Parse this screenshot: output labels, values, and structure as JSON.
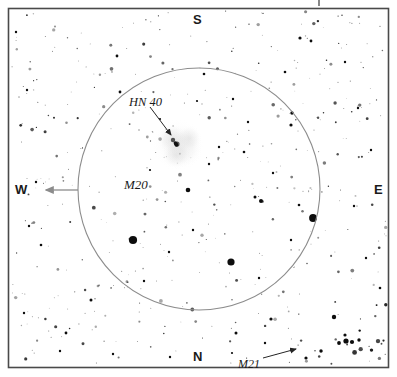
{
  "figure": {
    "kind": "astronomical-finder-chart",
    "frame_color": "#4a4a4a",
    "background_color": "#ffffff",
    "star_color": "#0d0d0d",
    "circle_color": "#8c8c8c",
    "arrow_color": "#8c8c8c",
    "nebula_color": "#c9c9c9"
  },
  "compass": {
    "north": "N",
    "south": "S",
    "east": "E",
    "west": "W"
  },
  "labels": {
    "hn40": "HN 40",
    "m20": "M20",
    "m21": "M21"
  },
  "chart_data": {
    "type": "scatter",
    "title": "",
    "xlabel": "",
    "ylabel": "",
    "xlim": [
      8,
      389
    ],
    "ylim": [
      8,
      368
    ],
    "grid": false,
    "legend": null,
    "annotations": [
      {
        "text": "HN 40",
        "x": 129,
        "y": 96,
        "arrow_to": [
          171,
          135
        ],
        "arrow_from": [
          150,
          107
        ]
      },
      {
        "text": "M20",
        "x": 124,
        "y": 178,
        "arrow_to": null,
        "arrow_from": null
      },
      {
        "text": "M21",
        "x": 238,
        "y": 358,
        "arrow_to": [
          296,
          349
        ],
        "arrow_from": [
          263,
          358
        ]
      },
      {
        "text": "W",
        "x": 15,
        "y": 183,
        "arrow_to": [
          46,
          190
        ],
        "arrow_from": [
          78,
          190
        ]
      }
    ],
    "fov_circle": {
      "cx": 199,
      "cy": 189,
      "r": 121,
      "stroke": "#8c8c8c",
      "stroke_width": 1.1
    },
    "nebula_blobs": [
      {
        "cx": 172,
        "cy": 139,
        "r": 15,
        "opacity": 0.3
      },
      {
        "cx": 189,
        "cy": 138,
        "r": 13,
        "opacity": 0.26
      },
      {
        "cx": 176,
        "cy": 155,
        "r": 14,
        "opacity": 0.26
      },
      {
        "cx": 183,
        "cy": 148,
        "r": 20,
        "opacity": 0.18
      },
      {
        "cx": 178,
        "cy": 145,
        "r": 27,
        "opacity": 0.12
      }
    ],
    "stars": [
      {
        "x": 133,
        "y": 240,
        "r": 4.1
      },
      {
        "x": 313,
        "y": 218,
        "r": 3.9
      },
      {
        "x": 231,
        "y": 262,
        "r": 3.6
      },
      {
        "x": 177,
        "y": 144,
        "r": 2.6
      },
      {
        "x": 173,
        "y": 140,
        "r": 2.2
      },
      {
        "x": 188,
        "y": 190,
        "r": 2.3
      },
      {
        "x": 346,
        "y": 341,
        "r": 2.6
      },
      {
        "x": 352,
        "y": 342,
        "r": 2.1
      },
      {
        "x": 339,
        "y": 343,
        "r": 1.9
      },
      {
        "x": 359,
        "y": 340,
        "r": 1.7
      },
      {
        "x": 345,
        "y": 335,
        "r": 1.6
      },
      {
        "x": 334,
        "y": 317,
        "r": 2.2
      },
      {
        "x": 321,
        "y": 351,
        "r": 1.7
      },
      {
        "x": 306,
        "y": 358,
        "r": 1.6
      },
      {
        "x": 261,
        "y": 201,
        "r": 2.0
      },
      {
        "x": 255,
        "y": 197,
        "r": 1.5
      },
      {
        "x": 291,
        "y": 125,
        "r": 1.6
      },
      {
        "x": 292,
        "y": 113,
        "r": 1.7
      },
      {
        "x": 117,
        "y": 56,
        "r": 1.4
      },
      {
        "x": 300,
        "y": 38,
        "r": 1.6
      },
      {
        "x": 311,
        "y": 41,
        "r": 1.4
      },
      {
        "x": 91,
        "y": 300,
        "r": 1.5
      },
      {
        "x": 236,
        "y": 333,
        "r": 1.5
      },
      {
        "x": 271,
        "y": 319,
        "r": 1.6
      },
      {
        "x": 204,
        "y": 74,
        "r": 1.3
      },
      {
        "x": 66,
        "y": 333,
        "r": 1.4
      },
      {
        "x": 120,
        "y": 92,
        "r": 1.4
      },
      {
        "x": 16,
        "y": 32,
        "r": 1.2
      },
      {
        "x": 27,
        "y": 90,
        "r": 1.2
      },
      {
        "x": 36,
        "y": 182,
        "r": 1.2
      },
      {
        "x": 29,
        "y": 226,
        "r": 1.2
      },
      {
        "x": 41,
        "y": 245,
        "r": 1.3
      },
      {
        "x": 24,
        "y": 313,
        "r": 1.2
      },
      {
        "x": 60,
        "y": 351,
        "r": 1.2
      },
      {
        "x": 113,
        "y": 354,
        "r": 1.2
      },
      {
        "x": 170,
        "y": 357,
        "r": 1.2
      },
      {
        "x": 232,
        "y": 353,
        "r": 1.1
      },
      {
        "x": 265,
        "y": 343,
        "r": 1.2
      },
      {
        "x": 380,
        "y": 288,
        "r": 1.3
      },
      {
        "x": 366,
        "y": 258,
        "r": 1.2
      },
      {
        "x": 354,
        "y": 206,
        "r": 1.2
      },
      {
        "x": 371,
        "y": 150,
        "r": 1.2
      },
      {
        "x": 358,
        "y": 108,
        "r": 1.2
      },
      {
        "x": 345,
        "y": 62,
        "r": 1.2
      },
      {
        "x": 285,
        "y": 72,
        "r": 1.3
      },
      {
        "x": 233,
        "y": 99,
        "r": 1.2
      },
      {
        "x": 197,
        "y": 101,
        "r": 1.1
      },
      {
        "x": 160,
        "y": 119,
        "r": 1.1
      },
      {
        "x": 150,
        "y": 170,
        "r": 1.1
      },
      {
        "x": 209,
        "y": 164,
        "r": 1.2
      },
      {
        "x": 244,
        "y": 152,
        "r": 1.3
      },
      {
        "x": 219,
        "y": 147,
        "r": 1.2
      },
      {
        "x": 193,
        "y": 230,
        "r": 1.2
      },
      {
        "x": 169,
        "y": 252,
        "r": 1.2
      },
      {
        "x": 144,
        "y": 281,
        "r": 1.2
      },
      {
        "x": 259,
        "y": 278,
        "r": 1.2
      },
      {
        "x": 291,
        "y": 240,
        "r": 1.2
      },
      {
        "x": 299,
        "y": 205,
        "r": 1.3
      },
      {
        "x": 273,
        "y": 173,
        "r": 1.2
      },
      {
        "x": 248,
        "y": 122,
        "r": 1.2
      }
    ]
  }
}
